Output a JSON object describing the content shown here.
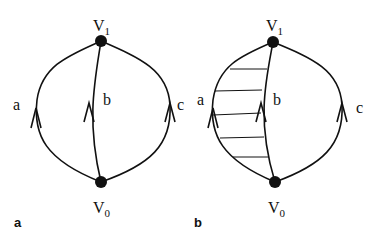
{
  "panels": [
    {
      "label": "a",
      "vertices": [
        {
          "name": "V",
          "sub": "1"
        },
        {
          "name": "V",
          "sub": "0"
        }
      ],
      "edges": [
        {
          "label": "a"
        },
        {
          "label": "b"
        },
        {
          "label": "c"
        }
      ],
      "shaded_region": null
    },
    {
      "label": "b",
      "vertices": [
        {
          "name": "V",
          "sub": "1"
        },
        {
          "name": "V",
          "sub": "0"
        }
      ],
      "edges": [
        {
          "label": "a"
        },
        {
          "label": "b"
        },
        {
          "label": "c"
        }
      ],
      "shaded_region": "between a and b (hatched)"
    }
  ],
  "colors": {
    "stroke": "#111111",
    "background": "#ffffff"
  }
}
